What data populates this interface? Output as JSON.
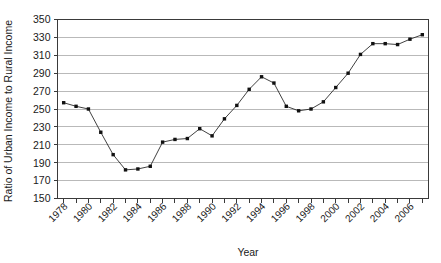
{
  "chart_data": {
    "type": "line",
    "title": "",
    "xlabel": "Year",
    "ylabel": "Ratio of Urban Income to Rural Income",
    "xlim": [
      1977.5,
      2007.5
    ],
    "ylim": [
      150,
      350
    ],
    "ytick_step": 20,
    "yticks": [
      150,
      170,
      190,
      210,
      230,
      250,
      270,
      290,
      310,
      330,
      350
    ],
    "ytick_labels": [
      "150",
      "170",
      "190",
      "210",
      "230",
      "250",
      "270",
      "290",
      "310",
      "330",
      "350"
    ],
    "xticks": [
      1978,
      1979,
      1980,
      1981,
      1982,
      1983,
      1984,
      1985,
      1986,
      1987,
      1988,
      1989,
      1990,
      1991,
      1992,
      1993,
      1994,
      1995,
      1996,
      1997,
      1998,
      1999,
      2000,
      2001,
      2002,
      2003,
      2004,
      2005,
      2006,
      2007
    ],
    "xtick_labels_shown": [
      "1978",
      "1980",
      "1982",
      "1984",
      "1986",
      "1988",
      "1990",
      "1992",
      "1994",
      "1996",
      "1998",
      "2000",
      "2002",
      "2004",
      "2006"
    ],
    "grid": true,
    "grid_axis": "y",
    "legend": false,
    "legend_position": "none",
    "marker": "square",
    "x": [
      1978,
      1979,
      1980,
      1981,
      1982,
      1983,
      1984,
      1985,
      1986,
      1987,
      1988,
      1989,
      1990,
      1991,
      1992,
      1993,
      1994,
      1995,
      1996,
      1997,
      1998,
      1999,
      2000,
      2001,
      2002,
      2003,
      2004,
      2005,
      2006,
      2007
    ],
    "values": [
      257,
      253,
      250,
      224,
      199,
      182,
      183,
      186,
      213,
      216,
      217,
      228,
      220,
      239,
      254,
      272,
      286,
      279,
      253,
      248,
      250,
      258,
      274,
      290,
      311,
      323,
      323,
      322,
      328,
      333
    ],
    "categories": [
      "1978",
      "1979",
      "1980",
      "1981",
      "1982",
      "1983",
      "1984",
      "1985",
      "1986",
      "1987",
      "1988",
      "1989",
      "1990",
      "1991",
      "1992",
      "1993",
      "1994",
      "1995",
      "1996",
      "1997",
      "1998",
      "1999",
      "2000",
      "2001",
      "2002",
      "2003",
      "2004",
      "2005",
      "2006",
      "2007"
    ],
    "colors": {
      "line": "#2b2b2b",
      "marker": "#111111",
      "grid": "#b9b9b9",
      "axis": "#3a3a3a",
      "background": "#ffffff"
    }
  }
}
